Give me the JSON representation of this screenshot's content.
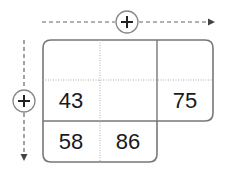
{
  "axes": {
    "horizontal_add_label": "+",
    "vertical_add_label": "+"
  },
  "grid": {
    "cells": [
      {
        "row": 0,
        "col": 0,
        "value": ""
      },
      {
        "row": 0,
        "col": 1,
        "value": ""
      },
      {
        "row": 0,
        "col": 2,
        "value": ""
      },
      {
        "row": 1,
        "col": 0,
        "value": "43"
      },
      {
        "row": 1,
        "col": 1,
        "value": ""
      },
      {
        "row": 1,
        "col": 2,
        "value": "75"
      },
      {
        "row": 2,
        "col": 0,
        "value": "58"
      },
      {
        "row": 2,
        "col": 1,
        "value": "86"
      }
    ]
  },
  "colors": {
    "stroke": "#777777",
    "dotted": "#aaaaaa",
    "text": "#1a1a1a"
  }
}
